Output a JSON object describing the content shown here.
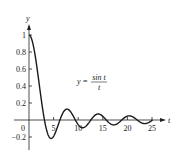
{
  "chart_data": {
    "type": "line",
    "title": "",
    "function": "y = sin t / t",
    "annotation": {
      "lhs": "y =",
      "numerator": "sin t",
      "denominator": "t"
    },
    "xlabel": "t",
    "ylabel": "y",
    "xlim": [
      0,
      26
    ],
    "ylim": [
      -0.25,
      1.1
    ],
    "x_ticks": [
      0,
      5,
      10,
      15,
      20,
      25
    ],
    "x_tick_labels": [
      "0",
      "5",
      "10",
      "15",
      "20",
      "25"
    ],
    "y_ticks": [
      -0.2,
      0.2,
      0.4,
      0.6,
      0.8,
      1
    ],
    "y_tick_labels": [
      "−0.2",
      "0.2",
      "0.4",
      "0.6",
      "0.8",
      "1"
    ],
    "grid": false,
    "legend": null,
    "series": [
      {
        "name": "sin t / t",
        "x": [
          0,
          1,
          2,
          3,
          3.1416,
          4,
          4.4934,
          5,
          6,
          6.2832,
          7,
          7.7253,
          8,
          9,
          9.4248,
          10,
          10.9041,
          11,
          12,
          12.5664,
          13,
          14,
          14.0662,
          15,
          15.708,
          16,
          17,
          17.2208,
          18,
          18.8496,
          19,
          20,
          20.3713,
          21,
          21.9911,
          22,
          23,
          23.5195,
          24,
          25,
          25.1327
        ],
        "values": [
          1,
          0.8415,
          0.4546,
          0.047,
          0,
          -0.1892,
          -0.2172,
          -0.1918,
          -0.0466,
          0,
          0.0939,
          0.1284,
          0.1237,
          0.0458,
          0,
          -0.0544,
          -0.0913,
          -0.0909,
          -0.0447,
          0,
          0.0323,
          0.0707,
          0.0709,
          0.0433,
          0,
          -0.018,
          -0.0566,
          -0.0578,
          -0.0417,
          0,
          0.0079,
          0.0456,
          0.049,
          0.0399,
          0,
          -0.0004,
          -0.0368,
          -0.0424,
          -0.0379,
          -0.0053,
          0
        ]
      }
    ]
  },
  "axes": {
    "x_label": "t",
    "y_label": "y"
  }
}
